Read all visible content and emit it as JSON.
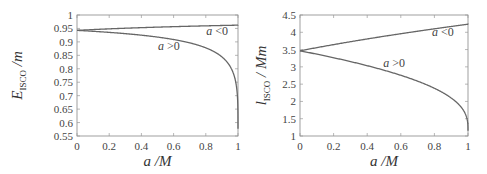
{
  "chart_data": [
    {
      "type": "line",
      "title": "",
      "xlabel": "a /M",
      "ylabel": "E_ISCO /m",
      "ylabel_main": "E",
      "ylabel_sub": "ISCO",
      "ylabel_tail": " /m",
      "xlim": [
        0,
        1
      ],
      "ylim": [
        0.55,
        1
      ],
      "xticks": [
        "0",
        "0.2",
        "0.4",
        "0.6",
        "0.8",
        "1"
      ],
      "yticks": [
        "0.55",
        "0.6",
        "0.65",
        "0.7",
        "0.75",
        "0.8",
        "0.85",
        "0.9",
        "0.95",
        "1"
      ],
      "grid": false,
      "legend": "none",
      "series": [
        {
          "name": "a < 0",
          "x": [
            0,
            0.2,
            0.4,
            0.6,
            0.8,
            1.0
          ],
          "values": [
            0.9428,
            0.9468,
            0.9506,
            0.9543,
            0.9577,
            0.9623
          ]
        },
        {
          "name": "a > 0",
          "x": [
            0,
            0.2,
            0.4,
            0.6,
            0.8,
            0.9,
            0.95,
            0.99,
            1.0
          ],
          "values": [
            0.9428,
            0.9358,
            0.9262,
            0.9118,
            0.886,
            0.8442,
            0.8216,
            0.7454,
            0.5774
          ]
        }
      ],
      "annotations": [
        {
          "text": "a <0",
          "italic_part": "a",
          "rest": " <0",
          "x": 0.87,
          "y": 0.925
        },
        {
          "text": "a >0",
          "italic_part": "a",
          "rest": " >0",
          "x": 0.57,
          "y": 0.868
        }
      ]
    },
    {
      "type": "line",
      "title": "",
      "xlabel": "a /M",
      "ylabel": "l_ISCO / Mm",
      "ylabel_main": "l",
      "ylabel_sub": "ISCO",
      "ylabel_tail": " / Mm",
      "xlim": [
        0,
        1
      ],
      "ylim": [
        1,
        4.5
      ],
      "xticks": [
        "0",
        "0.2",
        "0.4",
        "0.6",
        "0.8",
        "1"
      ],
      "yticks": [
        "1",
        "1.5",
        "2",
        "2.5",
        "3",
        "3.5",
        "4",
        "4.5"
      ],
      "grid": false,
      "legend": "none",
      "series": [
        {
          "name": "a < 0",
          "x": [
            0,
            0.2,
            0.4,
            0.6,
            0.8,
            1.0
          ],
          "values": [
            3.464,
            3.625,
            3.782,
            3.937,
            4.088,
            4.233
          ]
        },
        {
          "name": "a > 0",
          "x": [
            0,
            0.2,
            0.4,
            0.6,
            0.8,
            0.9,
            0.95,
            0.99,
            1.0
          ],
          "values": [
            3.464,
            3.289,
            3.098,
            2.883,
            2.618,
            2.323,
            2.141,
            1.756,
            1.155
          ]
        }
      ],
      "annotations": [
        {
          "text": "a <0",
          "italic_part": "a",
          "rest": " <0",
          "x": 0.85,
          "y": 3.9
        },
        {
          "text": "a >0",
          "italic_part": "a",
          "rest": " >0",
          "x": 0.56,
          "y": 3.0
        }
      ]
    }
  ]
}
